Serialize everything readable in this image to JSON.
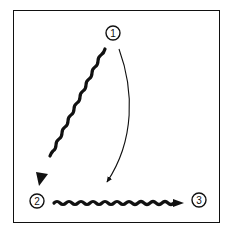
{
  "diagram": {
    "colors": {
      "stroke": "#111111",
      "background": "#ffffff"
    },
    "nodes": [
      {
        "id": "1",
        "label": "1",
        "cx": 113,
        "cy": 33,
        "r": 7
      },
      {
        "id": "2",
        "label": "2",
        "cx": 37,
        "cy": 201,
        "r": 7
      },
      {
        "id": "3",
        "label": "3",
        "cx": 199,
        "cy": 200,
        "r": 7
      }
    ],
    "edges": [
      {
        "from": "1",
        "to": "2",
        "style": "wavy-thick",
        "description": "thick wavy arrow from node 1 to node 2"
      },
      {
        "from": "1",
        "to": "3-direction",
        "style": "thin-curved",
        "description": "thin curved arrow from node 1 descending toward bottom center"
      },
      {
        "from": "2",
        "to": "3",
        "style": "wavy-thick",
        "description": "thick wavy arrow from node 2 to node 3"
      }
    ]
  }
}
